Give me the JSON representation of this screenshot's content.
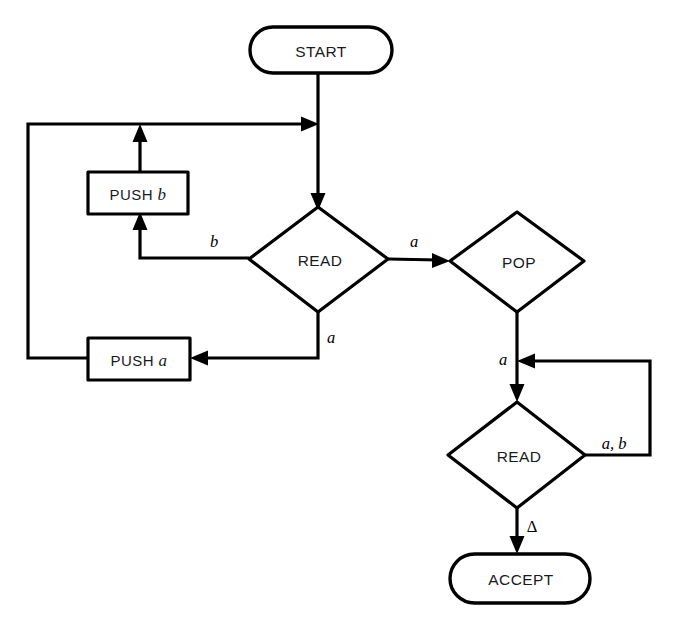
{
  "diagram": {
    "type": "flowchart",
    "background_color": "#ffffff",
    "line_color": "#000000",
    "text_color": "#1a1a1a"
  },
  "nodes": {
    "start": {
      "label": "START",
      "shape": "terminator"
    },
    "read_top": {
      "label": "READ",
      "shape": "decision"
    },
    "push_b": {
      "keyword": "PUSH",
      "argument": "b",
      "shape": "process"
    },
    "push_a": {
      "keyword": "PUSH",
      "argument": "a",
      "shape": "process"
    },
    "pop": {
      "label": "POP",
      "shape": "decision"
    },
    "read_bottom": {
      "label": "READ",
      "shape": "decision"
    },
    "accept": {
      "label": "ACCEPT",
      "shape": "terminator"
    }
  },
  "edge_labels": {
    "read_top_left_b": "b",
    "read_top_right_a": "a",
    "read_top_bottom_a": "a",
    "pop_down_a": "a",
    "read_bottom_loop_ab": "a, b",
    "read_bottom_delta": "Δ"
  }
}
